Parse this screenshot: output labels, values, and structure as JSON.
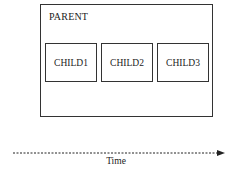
{
  "diagram": {
    "parent": {
      "label": "PARENT"
    },
    "children": [
      {
        "label": "CHILD1"
      },
      {
        "label": "CHILD2"
      },
      {
        "label": "CHILD3"
      }
    ],
    "axis": {
      "label": "Time",
      "style": "dashed-arrow"
    }
  }
}
